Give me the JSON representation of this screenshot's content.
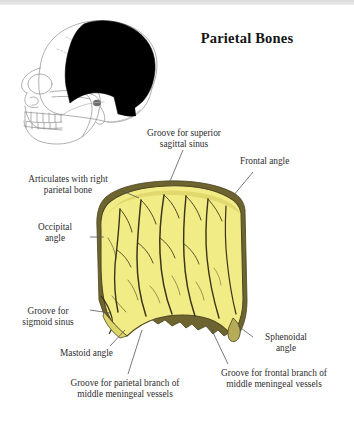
{
  "figure": {
    "title": "Parietal Bones",
    "bone_fill_color": "#f2ec86",
    "bone_outline_color": "#46401c",
    "skull_highlight_color": "#000000",
    "skull_line_color": "#8a8a8a",
    "leader_line_color": "#555555",
    "background_color": "#ffffff"
  },
  "labels": {
    "sagittal_sinus": "Groove for superior\nsagittal sinus",
    "frontal_angle": "Frontal angle",
    "articulates": "Articulates with right\nparietal bone",
    "occipital_angle": "Occipital\nangle",
    "sigmoid_sinus": "Groove for\nsigmoid sinus",
    "mastoid_angle": "Mastoid angle",
    "sphenoidal_angle": "Sphenoidal\nangle",
    "frontal_branch": "Groove for  frontal branch of\nmiddle meningeal vessels",
    "parietal_branch": "Groove for  parietal branch of\nmiddle meningeal vessels"
  }
}
